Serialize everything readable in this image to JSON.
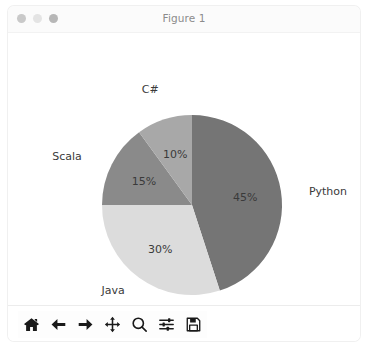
{
  "window": {
    "title": "Figure 1",
    "controls": [
      {
        "name": "close-button",
        "color": "#c9c9c9"
      },
      {
        "name": "minimize-button",
        "color": "#e4e4e4"
      },
      {
        "name": "maximize-button",
        "color": "#b7b7b7"
      }
    ]
  },
  "chart_data": {
    "type": "pie",
    "title": "",
    "categories": [
      "Python",
      "Java",
      "Scala",
      "C#"
    ],
    "values": [
      45,
      30,
      15,
      10
    ],
    "labels": [
      "Python",
      "Java",
      "Scala",
      "C#"
    ],
    "autopct": [
      "45%",
      "30%",
      "15%",
      "10%"
    ],
    "colors": [
      "#757575",
      "#dcdcdc",
      "#8a8a8a",
      "#a8a8a8"
    ],
    "startangle": 90,
    "counterclock": false,
    "legend": "none",
    "grid": false,
    "xlabel": "",
    "ylabel": ""
  },
  "toolbar": {
    "buttons": [
      {
        "name": "home-icon",
        "label": "Home"
      },
      {
        "name": "arrow-left-icon",
        "label": "Back"
      },
      {
        "name": "arrow-right-icon",
        "label": "Forward"
      },
      {
        "name": "move-icon",
        "label": "Pan"
      },
      {
        "name": "magnifier-icon",
        "label": "Zoom"
      },
      {
        "name": "sliders-icon",
        "label": "Configure subplots"
      },
      {
        "name": "floppy-disk-icon",
        "label": "Save"
      }
    ]
  }
}
